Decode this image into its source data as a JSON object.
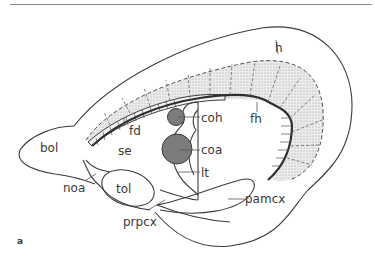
{
  "figure": {
    "panel_label": "a",
    "labels": {
      "h": "h",
      "fh": "fh",
      "fd": "fd",
      "coh": "coh",
      "coa": "coa",
      "lt": "lt",
      "se": "se",
      "bol": "bol",
      "noa": "noa",
      "tol": "tol",
      "prpcx": "prpcx",
      "pamcx": "pamcx"
    },
    "colors": {
      "stroke": "#3c3c3c",
      "stipple_fill": "#e2e2e2",
      "commissure_fill": "#7a7a7a",
      "background": "#ffffff"
    }
  }
}
